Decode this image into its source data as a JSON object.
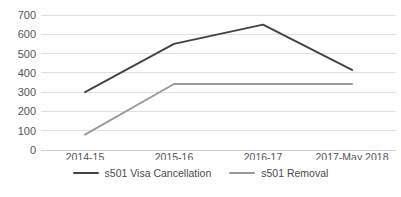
{
  "chart_data": {
    "type": "line",
    "title": "",
    "xlabel": "",
    "ylabel": "",
    "categories": [
      "2014-15",
      "2015-16",
      "2016-17",
      "2017-May 2018"
    ],
    "series": [
      {
        "name": "s501 Visa Cancellation",
        "color": "#434343",
        "values": [
          300,
          550,
          650,
          415
        ]
      },
      {
        "name": "s501 Removal",
        "color": "#9a9a9a",
        "values": [
          80,
          342,
          342,
          342
        ]
      }
    ],
    "ylim": [
      0,
      700
    ],
    "yticks": [
      0,
      100,
      200,
      300,
      400,
      500,
      600,
      700
    ],
    "ytick_labels": [
      "0",
      "100",
      "200",
      "300",
      "400",
      "500",
      "600",
      "700"
    ],
    "grid": "horizontal",
    "legend_position": "bottom"
  },
  "axis": {
    "y_labels": [
      "700",
      "600",
      "500",
      "400",
      "300",
      "200",
      "100",
      "0"
    ],
    "x_labels": [
      "2014-15",
      "2015-16",
      "2016-17",
      "2017-May 2018"
    ]
  },
  "legend": {
    "items": [
      {
        "label": "s501 Visa Cancellation",
        "color": "#434343"
      },
      {
        "label": "s501 Removal",
        "color": "#9a9a9a"
      }
    ]
  },
  "colors": {
    "gridline": "#e0e0e0",
    "text": "#555555",
    "background": "#ffffff"
  }
}
